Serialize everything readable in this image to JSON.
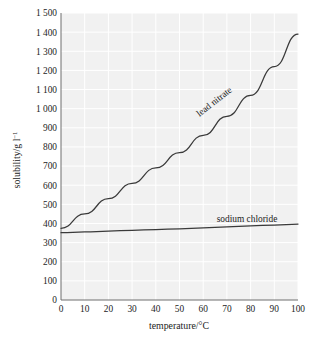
{
  "figure": {
    "name": "solubility-vs-temperature-graph",
    "background_color": "#ffffff",
    "plot_background_color": "#f1f1f1",
    "gridline_color": "#ffffff",
    "axis_color": "#6f6f6f",
    "line_color": "#3a3a3a"
  },
  "chart_data": {
    "type": "line",
    "title": "",
    "xlabel": "temperature/°C",
    "ylabel": "solubility/g l−1",
    "ylabel_base": "solubility/g l",
    "ylabel_exponent": "−1",
    "xlim": [
      0,
      100
    ],
    "ylim": [
      0,
      1500
    ],
    "grid": true,
    "legend_position": "inline-on-curve",
    "x_ticks": [
      0,
      10,
      20,
      30,
      40,
      50,
      60,
      70,
      80,
      90,
      100
    ],
    "x_tick_labels": [
      "0",
      "10",
      "20",
      "30",
      "40",
      "50",
      "60",
      "70",
      "80",
      "90",
      "100"
    ],
    "y_ticks": [
      0,
      100,
      200,
      300,
      400,
      500,
      600,
      700,
      800,
      900,
      1000,
      1100,
      1200,
      1300,
      1400,
      1500
    ],
    "y_tick_labels": [
      "0",
      "100",
      "200",
      "300",
      "400",
      "500",
      "600",
      "700",
      "800",
      "900",
      "1 000",
      "1 100",
      "1 200",
      "1 300",
      "1 400",
      "1 500"
    ],
    "x": [
      0,
      10,
      20,
      30,
      40,
      50,
      60,
      70,
      80,
      90,
      100
    ],
    "series": [
      {
        "name": "lead nitrate",
        "label": "lead nitrate",
        "label_rotation_deg": -38,
        "values": [
          375,
          450,
          530,
          610,
          690,
          770,
          860,
          960,
          1070,
          1220,
          1390
        ]
      },
      {
        "name": "sodium chloride",
        "label": "sodium chloride",
        "label_rotation_deg": 0,
        "values": [
          352,
          356,
          360,
          364,
          368,
          372,
          377,
          382,
          387,
          392,
          397
        ]
      }
    ]
  }
}
